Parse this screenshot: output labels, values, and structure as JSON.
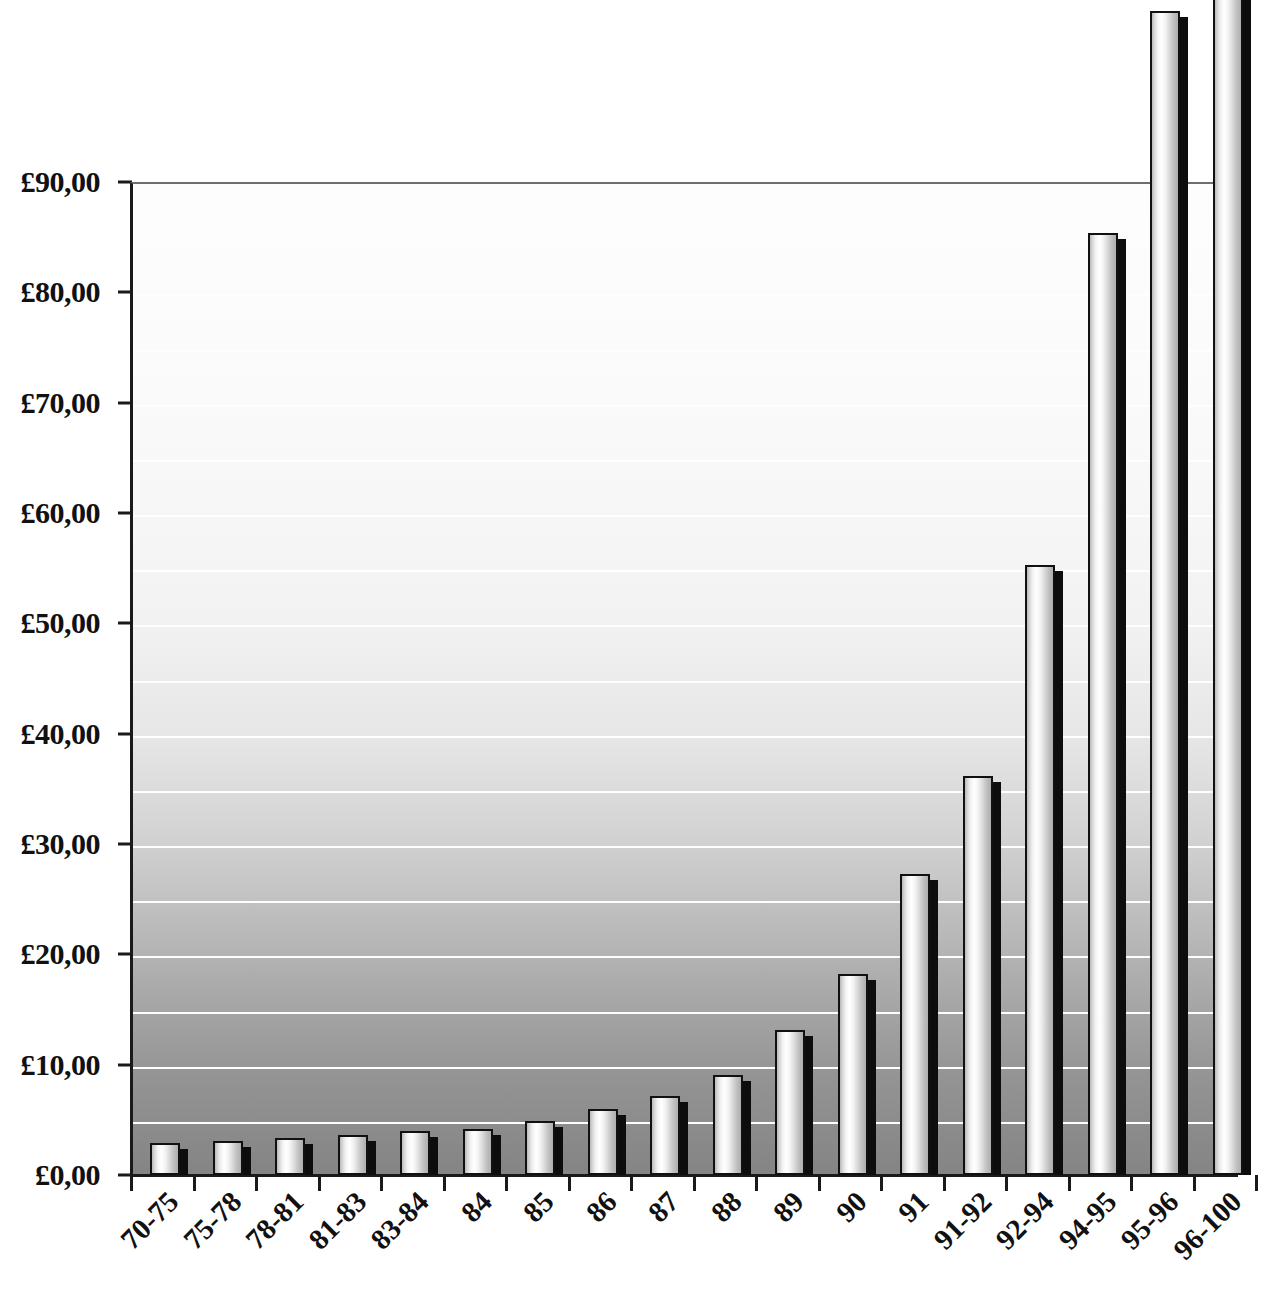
{
  "chart_data": {
    "type": "bar",
    "title": "",
    "subtitle": "",
    "xlabel": "",
    "ylabel": "",
    "ylim": [
      0,
      90
    ],
    "y_tick_step": 10,
    "gridline_step": 5,
    "grid": true,
    "legend": null,
    "currency_symbol": "£",
    "decimal_separator": ",",
    "categories": [
      "70-75",
      "75-78",
      "78-81",
      "81-83",
      "83-84",
      "84",
      "85",
      "86",
      "87",
      "88",
      "89",
      "90",
      "91",
      "91-92",
      "92-94",
      "94-95",
      "95-96",
      "96-100"
    ],
    "values": [
      2.9,
      3.1,
      3.4,
      3.6,
      4.0,
      4.2,
      4.9,
      6.0,
      7.2,
      9.1,
      13.1,
      18.2,
      27.3,
      36.2,
      55.3,
      85.4,
      105.5,
      120.0
    ],
    "clipped_above_axis": [
      "95-96",
      "96-100"
    ],
    "y_tick_labels": [
      "£90,00",
      "£80,00",
      "£70,00",
      "£60,00",
      "£50,00",
      "£40,00",
      "£30,00",
      "£20,00",
      "£10,00",
      "£0,00"
    ],
    "y_tick_values": [
      90,
      80,
      70,
      60,
      50,
      40,
      30,
      20,
      10,
      0
    ],
    "colors": {
      "bar_fill_light": "#ffffff",
      "bar_fill_dark": "#aeaeae",
      "bar_outline": "#111111",
      "bar_shadow": "#0d0d0d",
      "gridline": "#fefefe",
      "axis": "#1a1a1a",
      "plot_bg_top": "#fdfdfd",
      "plot_bg_bottom": "#848484",
      "text": "#111111"
    }
  }
}
